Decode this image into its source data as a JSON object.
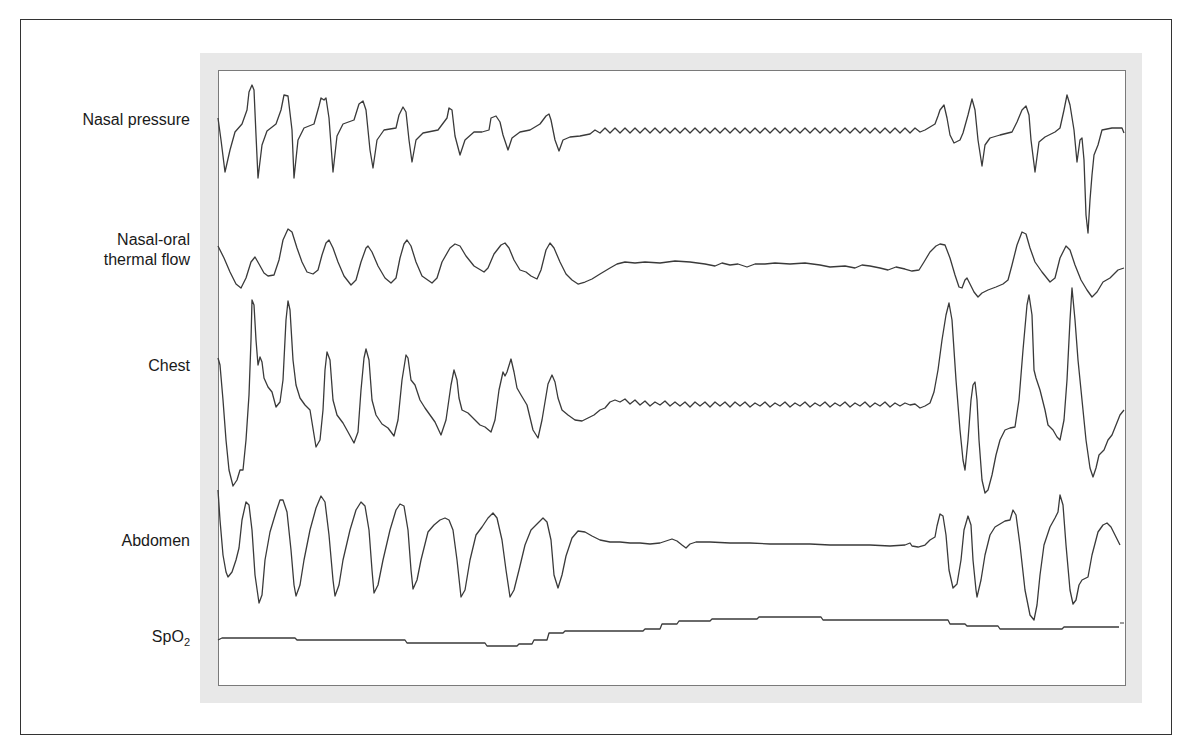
{
  "figure": {
    "type": "polysomnography-trace",
    "frame_color": "#e8e8e8",
    "trace_color": "#3a3a3a",
    "channels": [
      {
        "id": "nasal_pressure",
        "label": "Nasal pressure"
      },
      {
        "id": "thermal_flow",
        "label_line1": "Nasal-oral",
        "label_line2": "thermal flow"
      },
      {
        "id": "chest",
        "label": "Chest"
      },
      {
        "id": "abdomen",
        "label": "Abdomen"
      },
      {
        "id": "spo2",
        "label_main": "SpO",
        "label_sub": "2"
      }
    ]
  },
  "traces": {
    "nasal_pressure": "218,118 221,140 225,172 230,150 235,132 242,124 247,110 249,92 252,85 254,90 256,135 258,178 262,145 267,131 276,124 281,110 284,95 288,96 292,130 294,178 298,140 304,128 314,124 319,106 321,98 324,100 326,98 329,118 333,172 337,136 343,124 354,120 359,104 363,101 366,110 370,150 373,168 377,140 384,130 396,128 399,115 403,107 406,112 409,140 412,162 416,140 423,133 438,130 447,118 449,108 452,110 455,136 460,155 465,140 474,132 482,132 489,130 491,118 496,116 500,122 503,135 508,150 512,138 520,132 530,130 540,124 546,116 549,114 551,120 555,140 559,151 563,140 570,137 580,136 590,134 595,130 600,133 605,128 610,133 615,128 620,133 625,128 630,133 635,128 640,133 645,128 650,133 655,128 660,133 665,128 670,133 675,128 680,133 685,128 690,133 695,128 700,133 705,128 710,133 715,128 720,133 725,128 730,133 735,128 740,133 745,128 750,133 755,128 760,133 765,128 770,133 775,128 780,133 785,128 790,133 795,128 800,133 805,128 810,133 815,128 820,133 825,128 830,133 835,128 840,133 845,128 850,133 855,128 860,133 865,128 870,133 875,128 880,133 885,128 890,133 895,128 900,133 905,128 910,133 915,128 920,132 925,130 930,127 935,124 938,116 940,110 944,105 947,118 950,135 954,143 960,140 963,133 968,115 972,99 975,110 978,140 982,166 985,145 990,138 1000,135 1012,132 1017,122 1022,110 1026,106 1029,115 1031,140 1035,172 1039,142 1045,137 1055,132 1060,128 1064,110 1067,95 1070,105 1074,130 1077,162 1080,140 1082,138 1084,160 1086,215 1088,233 1090,200 1092,175 1094,155 1098,145 1102,130 1112,128 1122,128 1124,133",
    "thermal_flow": "218,246 224,258 230,272 236,284 241,288 246,278 251,262 255,257 259,264 264,273 268,276 274,275 279,260 283,240 288,229 292,232 297,248 302,262 307,272 313,274 318,270 322,255 326,243 329,240 333,248 338,262 344,276 351,285 356,280 361,262 366,248 368,246 372,252 378,266 385,278 391,283 396,278 400,258 404,244 407,240 411,246 416,262 422,276 432,283 437,278 442,262 450,248 455,244 460,246 466,256 474,266 484,272 488,268 494,254 501,245 505,243 509,248 514,260 520,270 526,272 531,276 537,279 541,270 546,250 550,243 554,248 560,262 566,274 572,280 578,284 585,282 592,279 600,274 610,268 617,264 625,262 635,263 645,262 660,263 675,261 690,262 705,264 715,266 722,263 730,265 738,264 747,267 755,264 765,264 775,263 790,264 805,263 820,265 830,267 845,266 855,268 862,265 870,266 880,268 888,270 896,267 905,269 912,271 919,270 924,262 930,252 936,246 940,244 945,245 950,258 955,275 959,287 962,288 965,280 967,278 970,284 974,292 978,297 982,293 988,290 996,287 1003,284 1008,280 1012,265 1017,245 1022,232 1026,234 1030,248 1035,262 1042,272 1050,282 1055,278 1060,258 1066,246 1070,250 1075,265 1081,280 1087,290 1092,297 1097,292 1103,282 1110,278 1118,270 1124,268",
    "chest": "218,358 220,365 223,400 226,440 229,470 233,486 237,480 240,470 243,470 246,440 249,395 251,340 252,300 254,305 256,340 258,365 260,357 262,362 264,378 268,387 272,392 276,407 280,402 283,380 286,320 288,301 290,310 293,360 296,385 300,398 305,405 310,410 316,447 320,440 323,410 325,370 327,352 330,360 333,400 337,415 343,423 348,432 354,443 358,432 361,390 364,358 366,349 369,360 372,400 376,415 382,424 388,428 394,436 398,420 402,380 406,355 408,358 411,380 415,385 420,400 425,408 430,415 435,422 441,435 446,420 451,385 454,370 457,380 459,398 462,410 468,413 475,420 480,425 485,427 491,432 495,420 499,390 503,372 505,376 507,372 511,359 514,372 517,388 521,395 527,405 533,430 538,438 542,420 548,384 552,375 555,382 558,398 562,410 568,415 575,420 582,421 588,418 594,415 600,410 605,408 610,402 615,400 620,402 625,399 630,404 635,400 640,405 645,401 650,406 655,402 660,405 665,401 670,406 675,402 680,406 685,402 690,407 695,402 700,406 705,402 710,407 715,402 720,406 725,402 730,407 735,402 740,406 745,402 750,407 755,403 760,406 765,402 770,407 775,403 780,406 785,402 790,407 795,403 800,406 805,402 810,407 815,403 820,406 825,402 830,407 835,403 840,406 845,402 850,407 855,403 860,406 865,402 870,407 875,403 880,406 885,402 890,407 895,403 900,406 905,403 910,405 915,404 920,408 925,406 930,403 934,392 938,370 942,340 946,315 949,303 952,320 956,380 960,430 963,460 965,470 968,440 971,400 973,385 975,382 977,400 979,440 982,480 985,493 988,490 992,475 996,455 1000,440 1005,430 1010,428 1015,427 1019,400 1023,350 1027,305 1029,295 1032,315 1034,370 1036,378 1040,390 1045,410 1048,425 1053,430 1057,437 1060,440 1064,420 1067,380 1070,320 1072,288 1075,320 1078,360 1082,400 1086,440 1090,468 1093,477 1096,468 1099,455 1104,450 1108,440 1112,435 1116,425 1120,415 1124,410",
    "abdomen": "218,490 220,520 223,555 226,572 228,577 232,572 236,560 239,548 242,520 246,502 249,505 252,530 255,575 259,603 262,595 265,560 270,532 276,512 280,500 283,500 287,512 291,550 294,585 296,596 300,585 304,560 310,530 316,508 321,496 325,502 329,535 333,580 335,596 339,585 343,560 350,530 356,510 361,502 365,506 369,530 372,570 374,593 378,585 383,560 390,530 396,510 400,504 404,506 408,530 411,570 413,589 417,580 421,560 428,532 434,525 440,520 445,518 449,520 453,530 457,560 461,597 465,590 470,560 476,535 482,527 488,518 493,513 497,518 502,540 506,570 510,597 514,590 519,570 525,545 531,530 537,524 543,518 547,522 551,540 554,575 558,588 562,575 566,556 572,538 578,531 585,532 592,536 600,540 610,542 620,542 630,543 640,543 650,544 660,543 666,541 672,539 677,541 682,545 686,548 690,544 696,542 710,542 730,543 750,543 770,544 790,544 810,544 830,545 850,545 870,545 890,546 905,545 910,543 912,546 918,547 925,545 930,540 935,537 937,526 940,514 943,516 946,535 949,570 953,588 957,584 961,560 964,530 968,516 971,525 973,560 976,590 977,597 981,580 985,555 990,535 995,527 1000,524 1005,521 1010,520 1013,510 1016,515 1020,545 1025,590 1030,615 1034,620 1037,605 1040,575 1044,545 1050,527 1055,518 1058,512 1060,495 1063,505 1066,545 1070,590 1073,604 1076,600 1079,585 1082,580 1086,578 1088,577 1092,555 1098,532 1103,525 1107,523 1111,527 1115,535 1120,545",
    "spo2": "218,640 222,638 295,638 297,640 405,640 407,643 485,643 487,646 517,646 519,644 532,644 534,640 547,640 549,633 563,633 565,631 643,631 645,629 660,629 662,624 677,624 679,621 710,621 712,619 757,619 759,617 821,617 823,620 948,620 950,624 965,624 967,626 998,626 1000,629 1062,629 1064,627 1119,627"
  }
}
